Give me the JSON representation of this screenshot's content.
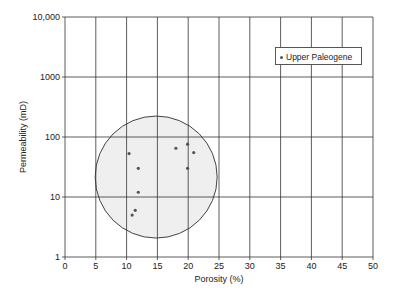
{
  "chart_data": {
    "type": "scatter",
    "title": "",
    "xlabel": "Porosity (%)",
    "ylabel": "Permeability (mD)",
    "xlim": [
      0,
      50
    ],
    "ylim": [
      1,
      10000
    ],
    "yscale": "log",
    "grid": true,
    "x_ticks": [
      "0",
      "5",
      "10",
      "15",
      "20",
      "25",
      "30",
      "35",
      "40",
      "45",
      "50"
    ],
    "y_ticks": [
      "1",
      "10",
      "100",
      "1000",
      "10,000"
    ],
    "legend": {
      "position": "upper right",
      "entries": [
        "Upper Paleogene"
      ]
    },
    "series": [
      {
        "name": "Upper Paleogene",
        "points": [
          {
            "x": 10.4,
            "y": 53
          },
          {
            "x": 11.9,
            "y": 30
          },
          {
            "x": 11.9,
            "y": 12
          },
          {
            "x": 11.4,
            "y": 6
          },
          {
            "x": 10.9,
            "y": 5
          },
          {
            "x": 18.0,
            "y": 65
          },
          {
            "x": 19.9,
            "y": 76
          },
          {
            "x": 20.9,
            "y": 55
          },
          {
            "x": 19.9,
            "y": 30
          }
        ]
      }
    ],
    "annotations": [
      {
        "type": "circle",
        "center": {
          "x": 14.8,
          "y": 21.5
        },
        "radius_px": 61,
        "fill": "#f0f0f0",
        "stroke": "#444444"
      }
    ]
  },
  "legend": {
    "label": "Upper Paleogene"
  },
  "axes": {
    "xlabel": "Porosity (%)",
    "ylabel": "Permeability (mD)"
  },
  "colors": {
    "grid": "#333333",
    "point": "#555555",
    "circle_fill": "#efefef",
    "circle_stroke": "#444444"
  }
}
